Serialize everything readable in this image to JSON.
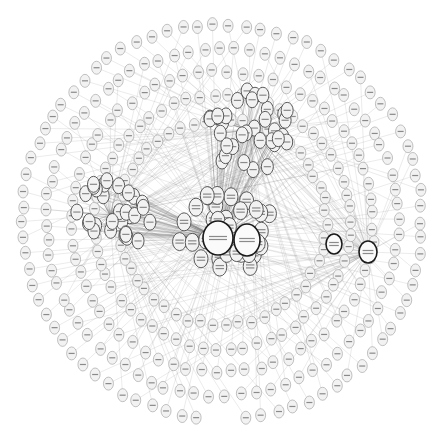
{
  "diagram": {
    "type": "network-graph",
    "title": "",
    "title_visible_but_illegible": true,
    "labels_legible": false,
    "colors": {
      "background": "#ffffff",
      "node_fill": "#f2f2f2",
      "node_stroke": "#9a9a9a",
      "hub_fill": "#fafafa",
      "hub_stroke": "#1a1a1a",
      "edge": "#6a6a6a",
      "label_bar": "#8a8a8a"
    },
    "hubs": [
      {
        "id": "center-hub",
        "cx": 218,
        "cy": 238,
        "rx": 15,
        "ry": 17
      },
      {
        "id": "center-hub-2",
        "cx": 247,
        "cy": 240,
        "rx": 13,
        "ry": 16
      },
      {
        "id": "right-hub",
        "cx": 368,
        "cy": 252,
        "rx": 9,
        "ry": 11
      },
      {
        "id": "right-hub-2",
        "cx": 334,
        "cy": 244,
        "rx": 8,
        "ry": 10
      }
    ],
    "clusters": [
      {
        "id": "center-cluster",
        "cx": 226,
        "cy": 232,
        "r": 48,
        "count": 38,
        "node_rx": 7,
        "node_ry": 9
      },
      {
        "id": "upper-cluster",
        "cx": 250,
        "cy": 130,
        "r": 45,
        "count": 34,
        "node_rx": 6,
        "node_ry": 8
      },
      {
        "id": "left-cluster",
        "cx": 110,
        "cy": 215,
        "r": 42,
        "count": 30,
        "node_rx": 6,
        "node_ry": 8
      }
    ],
    "outer_ring": {
      "cx": 222,
      "cy": 222,
      "rx": 200,
      "ry": 198,
      "rings": 5,
      "per_ring": [
        78,
        72,
        64,
        58,
        50
      ],
      "node_rx": 5,
      "node_ry": 6.5
    }
  }
}
